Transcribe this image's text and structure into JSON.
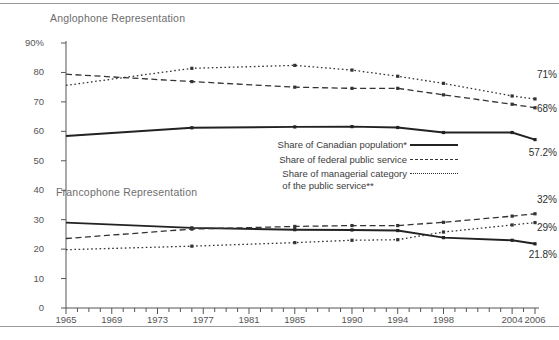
{
  "figure": {
    "anglophone_section_title": "Anglophone Representation",
    "francophone_section_title": "Francophone Representation"
  },
  "legend": {
    "items": [
      {
        "label": "Share of Canadian population*",
        "style": "solid"
      },
      {
        "label": "Share of federal public service",
        "style": "dashed"
      },
      {
        "label": "Share of managerial category\nof the public service**",
        "style": "dotted"
      }
    ]
  },
  "end_labels": {
    "anglo_managerial": "71%",
    "anglo_public_service": "68%",
    "anglo_population": "57.2%",
    "franco_public_service": "32%",
    "franco_managerial": "29%",
    "franco_population": "21.8%"
  },
  "chart_data": {
    "type": "line",
    "title": "",
    "subtitle": "",
    "xlabel": "",
    "ylabel": "",
    "xlim": [
      1965,
      2006
    ],
    "ylim": [
      0,
      90
    ],
    "grid": false,
    "legend_position": "center-right",
    "y_ticks": [
      0,
      10,
      20,
      30,
      40,
      50,
      60,
      70,
      80,
      90
    ],
    "y_tick_labels": [
      "0",
      "10",
      "20",
      "30",
      "40",
      "50",
      "60",
      "70",
      "80",
      "90%"
    ],
    "x_tick_labels": [
      "1965",
      "1969",
      "1973",
      "1977",
      "1981",
      "1985",
      "1990",
      "1994",
      "1998",
      "2004",
      "2006"
    ],
    "x_tick_values": [
      1965,
      1969,
      1973,
      1977,
      1981,
      1985,
      1990,
      1994,
      1998,
      2004,
      2006
    ],
    "x_minor_tick_step": 1,
    "footnotes": [
      "*",
      "**"
    ],
    "series": [
      {
        "name": "Anglophone — Share of Canadian population*",
        "group": "Anglophone Representation",
        "style": "solid",
        "color": "#222222",
        "x": [
          1965,
          1976,
          1985,
          1990,
          1994,
          1998,
          2004,
          2006
        ],
        "values": [
          58.4,
          61.2,
          61.5,
          61.6,
          61.3,
          59.6,
          59.6,
          57.2
        ],
        "end_label": "57.2%"
      },
      {
        "name": "Anglophone — Share of federal public service",
        "group": "Anglophone Representation",
        "style": "dashed",
        "color": "#333333",
        "x": [
          1965,
          1976,
          1985,
          1990,
          1994,
          1998,
          2004,
          2006
        ],
        "values": [
          79.4,
          76.9,
          75.0,
          74.6,
          74.6,
          72.4,
          69.2,
          68.0
        ],
        "end_label": "68%"
      },
      {
        "name": "Anglophone — Share of managerial category of the public service**",
        "group": "Anglophone Representation",
        "style": "dotted",
        "color": "#333333",
        "x": [
          1965,
          1976,
          1985,
          1990,
          1994,
          1998,
          2004,
          2006
        ],
        "values": [
          75.6,
          81.4,
          82.4,
          80.8,
          78.7,
          76.3,
          72.0,
          71.0
        ],
        "end_label": "71%"
      },
      {
        "name": "Francophone — Share of Canadian population*",
        "group": "Francophone Representation",
        "style": "solid",
        "color": "#222222",
        "x": [
          1965,
          1976,
          1985,
          1990,
          1994,
          1998,
          2004,
          2006
        ],
        "values": [
          29.0,
          27.2,
          26.6,
          26.5,
          26.3,
          23.9,
          23.0,
          21.8
        ],
        "end_label": "21.8%"
      },
      {
        "name": "Francophone — Share of federal public service",
        "group": "Francophone Representation",
        "style": "dashed",
        "color": "#333333",
        "x": [
          1965,
          1976,
          1985,
          1990,
          1994,
          1998,
          2004,
          2006
        ],
        "values": [
          23.6,
          26.8,
          27.7,
          28.0,
          28.0,
          29.1,
          31.2,
          32.0
        ],
        "end_label": "32%"
      },
      {
        "name": "Francophone — Share of managerial category of the public service**",
        "group": "Francophone Representation",
        "style": "dotted",
        "color": "#333333",
        "x": [
          1965,
          1976,
          1985,
          1990,
          1994,
          1998,
          2004,
          2006
        ],
        "values": [
          19.8,
          21.0,
          22.2,
          23.0,
          23.2,
          25.8,
          28.2,
          29.0
        ],
        "end_label": "29%"
      }
    ]
  }
}
